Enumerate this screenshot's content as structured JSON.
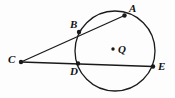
{
  "figure": {
    "name": "circle-with-two-secants-from-external-point",
    "background_color": "#fdfdfd",
    "stroke_color": "#1a1a1a",
    "label_color": "#121212",
    "canvas": {
      "width": 175,
      "height": 98
    },
    "circle": {
      "name": "circle-Q",
      "center_label": "Q",
      "cx": 115,
      "cy": 51,
      "r": 40,
      "stroke_width": 1.3
    },
    "points": [
      {
        "id": "A",
        "label": "A",
        "x": 124.5,
        "y": 15.5,
        "label_x": 129,
        "label_y": 3,
        "dot": true,
        "on_circle": true
      },
      {
        "id": "B",
        "label": "B",
        "x": 79,
        "y": 32,
        "label_x": 70,
        "label_y": 19,
        "dot": true,
        "on_circle": true
      },
      {
        "id": "C",
        "label": "C",
        "x": 21,
        "y": 62,
        "label_x": 8,
        "label_y": 54,
        "dot": true,
        "on_circle": false
      },
      {
        "id": "D",
        "label": "D",
        "x": 78,
        "y": 63.5,
        "label_x": 70,
        "label_y": 66,
        "dot": true,
        "on_circle": true
      },
      {
        "id": "E",
        "label": "E",
        "x": 153,
        "y": 66.5,
        "label_x": 158,
        "label_y": 61,
        "dot": true,
        "on_circle": true
      },
      {
        "id": "Q",
        "label": "Q",
        "x": 113,
        "y": 49,
        "label_x": 118,
        "label_y": 44,
        "dot": true,
        "on_circle": false
      }
    ],
    "segments": [
      {
        "name": "secant-C-B-A",
        "from": "C",
        "to": "A",
        "x1": 21,
        "y1": 62,
        "x2": 124.5,
        "y2": 15.5
      },
      {
        "name": "secant-C-D-E",
        "from": "C",
        "to": "E",
        "x1": 21,
        "y1": 62,
        "x2": 153,
        "y2": 66.5
      }
    ],
    "dot_radius": 2.2,
    "center_dot_radius": 1.7
  }
}
